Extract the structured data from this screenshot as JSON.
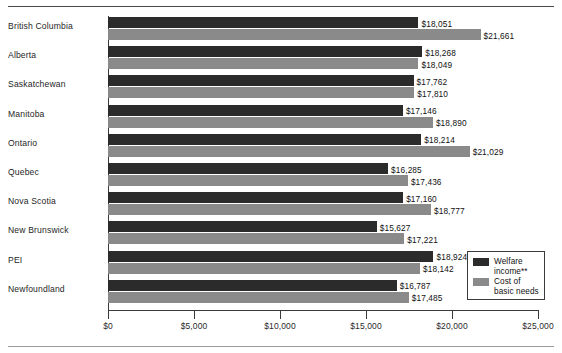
{
  "chart_data": {
    "type": "bar",
    "orientation": "horizontal",
    "title": "",
    "xlabel": "",
    "ylabel": "",
    "xlim": [
      0,
      25000
    ],
    "grid": false,
    "legend_position": "bottom-right",
    "categories": [
      "British Columbia",
      "Alberta",
      "Saskatchewan",
      "Manitoba",
      "Ontario",
      "Quebec",
      "Nova Scotia",
      "New Brunswick",
      "PEI",
      "Newfoundland"
    ],
    "tick_labels": [
      "$0",
      "$5,000",
      "$10,000",
      "$15,000",
      "$20,000",
      "$25,000"
    ],
    "tick_values": [
      0,
      5000,
      10000,
      15000,
      20000,
      25000
    ],
    "series": [
      {
        "name": "Welfare income**",
        "color": "#2b2b2b",
        "values": [
          18051,
          18268,
          17762,
          17146,
          18214,
          16285,
          17160,
          15627,
          18924,
          16787
        ],
        "value_labels": [
          "$18,051",
          "$18,268",
          "$17,762",
          "$17,146",
          "$18,214",
          "$16,285",
          "$17,160",
          "$15,627",
          "$18,924",
          "$16,787"
        ]
      },
      {
        "name": "Cost of basic needs",
        "color": "#8a8a8a",
        "values": [
          21661,
          18049,
          17810,
          18890,
          21029,
          17436,
          18777,
          17221,
          18142,
          17485
        ],
        "value_labels": [
          "$21,661",
          "$18,049",
          "$17,810",
          "$18,890",
          "$21,029",
          "$17,436",
          "$18,777",
          "$17,221",
          "$18,142",
          "$17,485"
        ]
      }
    ]
  },
  "legend": {
    "items": [
      {
        "label": "Welfare\nincome**",
        "color": "#2b2b2b"
      },
      {
        "label": "Cost of\nbasic needs",
        "color": "#8a8a8a"
      }
    ]
  }
}
